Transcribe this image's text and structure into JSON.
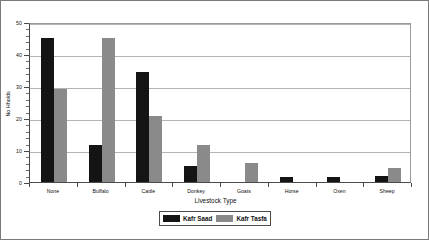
{
  "chart_data": {
    "type": "bar",
    "title": "",
    "xlabel": "Livestock Type",
    "ylabel": "No Hholds",
    "ylim": [
      0,
      50
    ],
    "ytick_labels": [
      "0",
      "10",
      "20",
      "30",
      "40",
      "50"
    ],
    "ytick_values": [
      0,
      10,
      20,
      30,
      40,
      50
    ],
    "yminor_step": 2,
    "grid": true,
    "grid_axis": "y",
    "legend_position": "bottom",
    "categories": [
      "None",
      "Buffalo",
      "Cattle",
      "Donkey",
      "Goats",
      "Horse",
      "Oxen",
      "Sheep"
    ],
    "series": [
      {
        "name": "Kafr Saad",
        "color": "#141414",
        "values": [
          45,
          11.5,
          34.5,
          5,
          0,
          1.5,
          1.5,
          2
        ]
      },
      {
        "name": "Kafr Tasfa",
        "color": "#8a8a8a",
        "values": [
          29,
          45,
          20.5,
          11.5,
          6,
          0,
          0,
          4.5
        ]
      }
    ]
  },
  "legend": {
    "entries": [
      {
        "label": "Kafr Saad",
        "swatch": "black-swatch"
      },
      {
        "label": "Kafr Tasfa",
        "swatch": "gray-swatch"
      }
    ]
  }
}
